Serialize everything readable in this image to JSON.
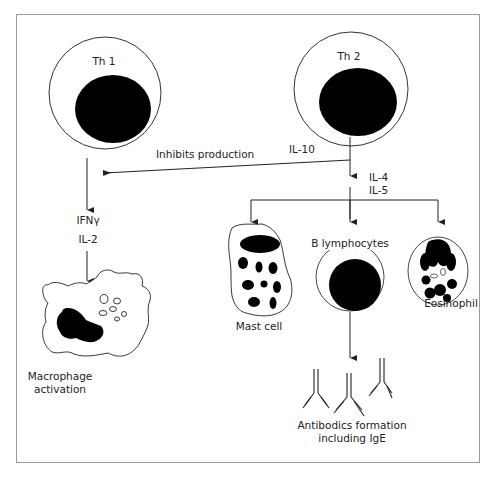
{
  "diagram": {
    "type": "immune cell signaling flow",
    "nodes": {
      "th1": {
        "label": "Th 1"
      },
      "th2": {
        "label": "Th 2"
      },
      "macrophage": {
        "label_line1": "Macrophage",
        "label_line2": "activation"
      },
      "mast_cell": {
        "label": "Mast cell"
      },
      "b_lymphocytes": {
        "label": "B lymphocytes"
      },
      "eosinophil": {
        "label": "Eosinophil"
      },
      "antibodies": {
        "label_line1": "Antibodics formation",
        "label_line2": "including IgE"
      }
    },
    "edges": {
      "th2_to_th1_pathway": {
        "label": "Inhibits production",
        "cytokine": "IL-10"
      },
      "th1_cytokines": {
        "line1": "IFNγ",
        "line2": "IL-2"
      },
      "th2_cytokines": {
        "line1": "IL-4",
        "line2": "IL-5"
      }
    },
    "colors": {
      "line": "#222222",
      "fill": "#000000",
      "frame": "#9a9a9a"
    }
  }
}
